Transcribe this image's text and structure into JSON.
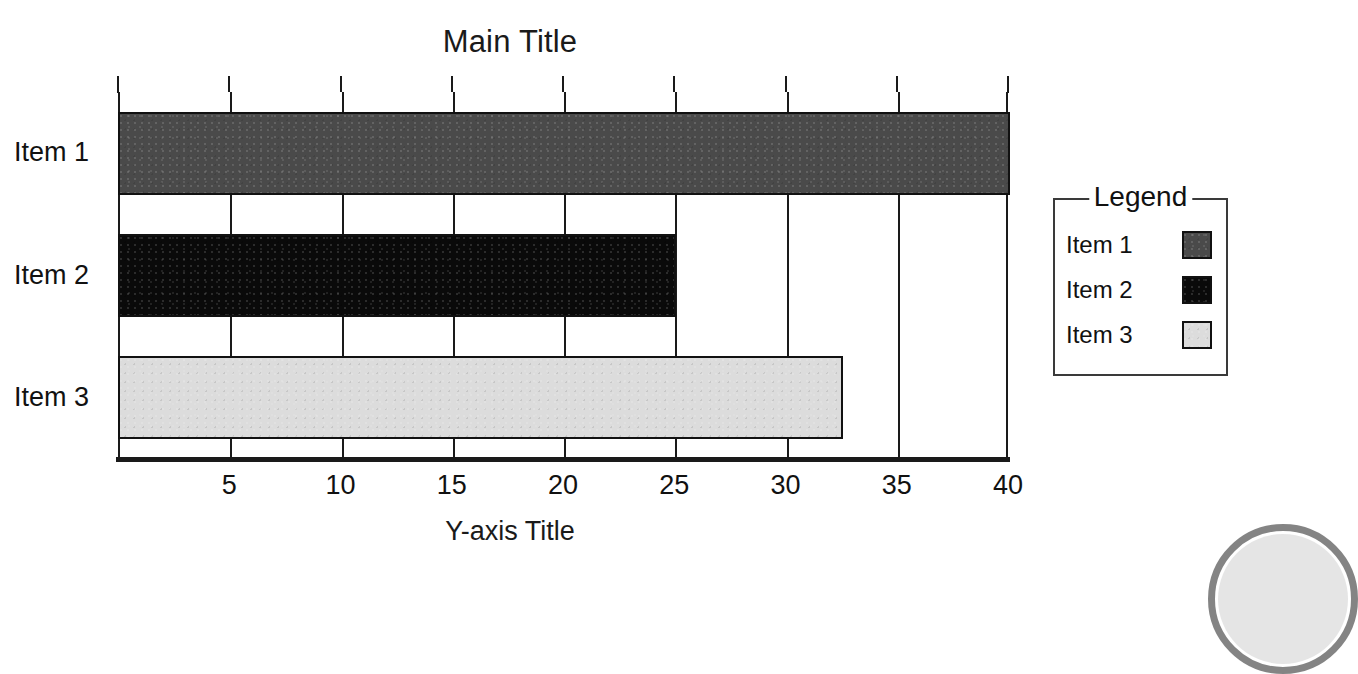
{
  "chart_data": {
    "type": "bar",
    "orientation": "horizontal",
    "title": "Main Title",
    "xlabel": "Y-axis Title",
    "ylabel": "",
    "categories": [
      "Item 1",
      "Item 2",
      "Item 3"
    ],
    "values": [
      40,
      25,
      32.5
    ],
    "series": [
      {
        "name": "Item 1",
        "value": 40,
        "color": "#4a4a4a"
      },
      {
        "name": "Item 2",
        "value": 25,
        "color": "#0a0a0a"
      },
      {
        "name": "Item 3",
        "value": 32.5,
        "color": "#dcdcdc"
      }
    ],
    "xlim": [
      0,
      40
    ],
    "xticks": [
      0,
      5,
      10,
      15,
      20,
      25,
      30,
      35,
      40
    ],
    "xtick_labels": [
      "",
      "5",
      "10",
      "15",
      "20",
      "25",
      "30",
      "35",
      "40"
    ],
    "grid": true,
    "grid_axis": "x",
    "legend": {
      "title": "Legend",
      "position": "right",
      "entries": [
        {
          "label": "Item 1",
          "color": "#4a4a4a"
        },
        {
          "label": "Item 2",
          "color": "#0a0a0a"
        },
        {
          "label": "Item 3",
          "color": "#dcdcdc"
        }
      ]
    }
  },
  "colors": {
    "axis": "#1a1a1a",
    "grid": "#1a1a1a",
    "text": "#111111",
    "background": "#ffffff",
    "bar_outline": "#111111",
    "legend_border": "#3a3a3a"
  }
}
